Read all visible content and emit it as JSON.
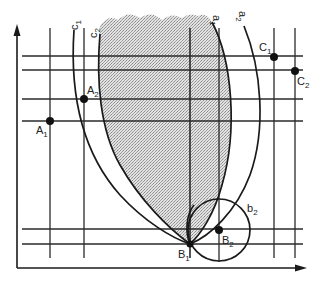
{
  "diagram": {
    "type": "geometric-construction",
    "colors": {
      "line": "#1a1a1a",
      "grid": "#2a2a2a",
      "shade": "#c9c9c9",
      "background": "#ffffff"
    },
    "axes": {
      "x_axis": {
        "from": [
          17,
          268
        ],
        "to": [
          305,
          268
        ],
        "arrow": true
      },
      "y_axis": {
        "from": [
          17,
          268
        ],
        "to": [
          17,
          25
        ],
        "arrow": true
      }
    },
    "horizontal_lines_y": [
      56,
      70,
      99,
      121,
      229,
      244
    ],
    "vertical_lines_x": [
      50,
      84,
      190,
      219,
      274,
      295
    ],
    "points": [
      {
        "id": "A1",
        "base": "A",
        "sub": "1",
        "x": 50,
        "y": 121,
        "label_x": 36,
        "label_y": 134
      },
      {
        "id": "A2",
        "base": "A",
        "sub": "2",
        "x": 84,
        "y": 99,
        "label_x": 87,
        "label_y": 94
      },
      {
        "id": "B1",
        "base": "B",
        "sub": "1",
        "x": 190,
        "y": 244,
        "label_x": 178,
        "label_y": 258
      },
      {
        "id": "B2",
        "base": "B",
        "sub": "2",
        "x": 219,
        "y": 230,
        "label_x": 222,
        "label_y": 244
      },
      {
        "id": "C1",
        "base": "C",
        "sub": "1",
        "x": 274,
        "y": 57,
        "label_x": 259,
        "label_y": 51
      },
      {
        "id": "C2",
        "base": "C",
        "sub": "2",
        "x": 295,
        "y": 71,
        "label_x": 297,
        "label_y": 85
      }
    ],
    "curves": [
      {
        "id": "c1",
        "base": "c",
        "sub": "1",
        "label_x": 75,
        "label_y": 28,
        "rotate": -90
      },
      {
        "id": "c2",
        "base": "c",
        "sub": "2",
        "label_x": 95,
        "label_y": 34,
        "rotate": -90
      },
      {
        "id": "a1",
        "base": "a",
        "sub": "1",
        "label_x": 216,
        "label_y": 22,
        "rotate": 90
      },
      {
        "id": "a2",
        "base": "a",
        "sub": "2",
        "label_x": 242,
        "label_y": 17,
        "rotate": 90
      }
    ],
    "circle": {
      "id": "b2",
      "base": "b",
      "sub": "2",
      "cx": 219,
      "cy": 230,
      "r": 31,
      "label_x": 247,
      "label_y": 212
    },
    "shaded_region": "area bounded by curve c2 and curve a1, from top edge down to B1"
  }
}
